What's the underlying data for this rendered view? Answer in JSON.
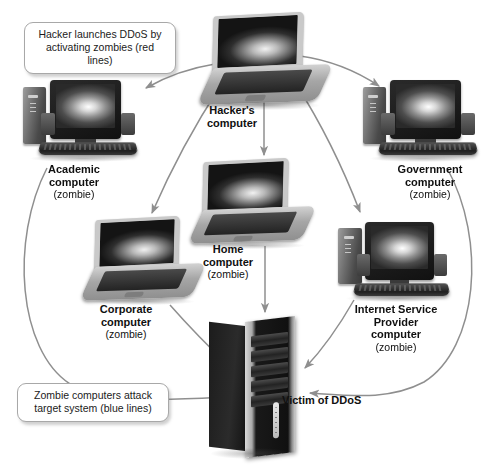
{
  "diagram": {
    "callouts": [
      {
        "id": "hacker-callout",
        "text": "Hacker launches DDoS by\nactivating zombies (red lines)"
      },
      {
        "id": "zombie-callout",
        "text": "Zombie computers attack\ntarget system (blue lines)"
      }
    ],
    "nodes": {
      "hacker": {
        "title": "Hacker's\ncomputer",
        "sub": "",
        "device": "laptop"
      },
      "academic": {
        "title": "Academic\ncomputer",
        "sub": "(zombie)",
        "device": "desktop"
      },
      "government": {
        "title": "Government\ncomputer",
        "sub": "(zombie)",
        "device": "desktop"
      },
      "home": {
        "title": "Home\ncomputer",
        "sub": "(zombie)",
        "device": "laptop"
      },
      "corporate": {
        "title": "Corporate\ncomputer",
        "sub": "(zombie)",
        "device": "laptop"
      },
      "isp": {
        "title": "Internet Service\nProvider\ncomputer",
        "sub": "(zombie)",
        "device": "desktop"
      },
      "victim": {
        "title": "Victim of DDoS",
        "sub": "",
        "device": "tower"
      }
    },
    "colors": {
      "arrow": "#8c8c8c",
      "callout_border": "#a8a8a8",
      "text": "#101010",
      "background": "#ffffff"
    },
    "legend": {
      "activation_lines": "red lines",
      "attack_lines": "blue lines"
    }
  }
}
